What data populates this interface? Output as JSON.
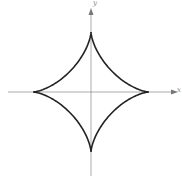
{
  "chart_data": {
    "type": "line",
    "title": "",
    "curve_identification": "astroid (x^(2/3) + y^(2/3) = a^(2/3)), inferred from shape; not labeled in image",
    "parametric": "x = a*cos^3(t), y = a*sin^3(t)",
    "xlabel": "x",
    "ylabel": "y",
    "axis_labels_note": "axis label glyphs were too blurred to read; 'x'/'y' assumed by convention",
    "xlim": [
      -1.3,
      1.3
    ],
    "ylim": [
      -1.3,
      1.3
    ],
    "grid": false,
    "legend": null,
    "series": [
      {
        "name": "astroid",
        "cusps": [
          {
            "x": 1,
            "y": 0
          },
          {
            "x": 0,
            "y": 1
          },
          {
            "x": -1,
            "y": 0
          },
          {
            "x": 0,
            "y": -1
          }
        ],
        "color": "#222222"
      }
    ],
    "pixel_geometry": {
      "origin": [
        91,
        92
      ],
      "radius_x_px": 58,
      "radius_y_px": 60,
      "x_axis_span": [
        8,
        178
      ],
      "y_axis_span": [
        8,
        176
      ]
    }
  },
  "axes": {
    "x_label": "x",
    "y_label": "y",
    "axis_color": "#777777",
    "curve_color": "#222222"
  }
}
